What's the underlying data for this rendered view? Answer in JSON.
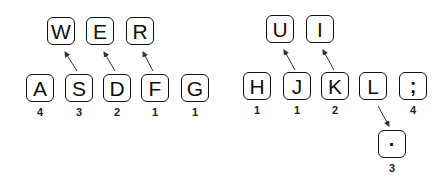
{
  "diagram": {
    "title": "",
    "left_hand": {
      "home_row": [
        {
          "key": "A",
          "finger": "4"
        },
        {
          "key": "S",
          "finger": "3"
        },
        {
          "key": "D",
          "finger": "2"
        },
        {
          "key": "F",
          "finger": "1"
        },
        {
          "key": "G",
          "finger": "1"
        }
      ],
      "top_row": [
        {
          "key": "W",
          "from": "S"
        },
        {
          "key": "E",
          "from": "D"
        },
        {
          "key": "R",
          "from": "F"
        }
      ]
    },
    "right_hand": {
      "home_row": [
        {
          "key": "H",
          "finger": "1"
        },
        {
          "key": "J",
          "finger": "1"
        },
        {
          "key": "K",
          "finger": "2"
        },
        {
          "key": "L",
          "finger": ""
        },
        {
          "key": ";",
          "finger": "4"
        }
      ],
      "top_row": [
        {
          "key": "U",
          "from": "J"
        },
        {
          "key": "I",
          "from": "K"
        }
      ],
      "bottom_row": [
        {
          "key": "·",
          "from": "L",
          "finger": "3"
        }
      ]
    },
    "colors": {
      "key_border": "#111111",
      "text": "#111111",
      "background": "#ffffff"
    }
  }
}
